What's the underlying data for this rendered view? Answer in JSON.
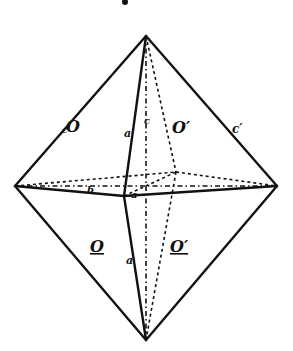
{
  "figure": {
    "type": "octahedron",
    "face_labels": {
      "upper_front_left": "O",
      "upper_back_right": "O′",
      "lower_front_left": "O",
      "lower_back_right": "O′"
    },
    "edge_labels": {
      "upper_left_edge": "c",
      "front_upper_edge": "a",
      "back_upper_edge": "c",
      "upper_right_edge": "c′",
      "front_lower_edge": "a",
      "equator_left": "b",
      "equator_center": "a"
    }
  }
}
